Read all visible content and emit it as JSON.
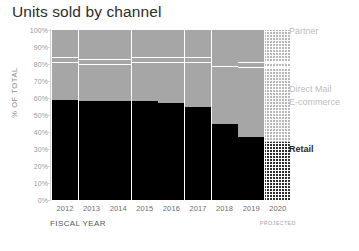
{
  "chart_data": {
    "type": "bar",
    "title": "Units sold by channel",
    "subtype": "stacked-100-percent",
    "xlabel": "FISCAL YEAR",
    "ylabel": "% OF TOTAL",
    "ylim": [
      0,
      100
    ],
    "ytick_labels": [
      "100%",
      "90%",
      "80%",
      "70%",
      "60%",
      "50%",
      "40%",
      "30%",
      "20%",
      "10%",
      "0%"
    ],
    "ytick_values": [
      100,
      90,
      80,
      70,
      60,
      50,
      40,
      30,
      20,
      10,
      0
    ],
    "grid": false,
    "legend_position": "right",
    "categories": [
      "2012",
      "2013",
      "2014",
      "2015",
      "2016",
      "2017",
      "2018",
      "2019",
      "2020"
    ],
    "projected_categories": [
      "2020"
    ],
    "projected_note": "PROJECTED",
    "series": [
      {
        "name": "Retail",
        "color": "#000000",
        "values": [
          59,
          58,
          58,
          58,
          57,
          55,
          45,
          37,
          34
        ]
      },
      {
        "name": "E-commerce",
        "color": "#a6a6a6",
        "values": [
          22,
          22,
          22,
          23,
          24,
          26,
          34,
          41,
          44
        ]
      },
      {
        "name": "Direct Mail",
        "color": "#a6a6a6",
        "values": [
          3,
          3,
          3,
          3,
          3,
          3,
          3,
          3,
          3
        ]
      },
      {
        "name": "Partner",
        "color": "#a6a6a6",
        "values": [
          16,
          17,
          17,
          16,
          16,
          16,
          18,
          19,
          19
        ]
      }
    ],
    "legend_entries": [
      {
        "label": "Partner",
        "color": "#bdbdbd"
      },
      {
        "label": "Direct Mail",
        "color": "#bdbdbd"
      },
      {
        "label": "E-commerce",
        "color": "#bdbdbd"
      },
      {
        "label": "Retail",
        "color": "#1f1f1f"
      }
    ]
  },
  "legend": {
    "partner": "Partner",
    "direct_mail": "Direct Mail",
    "ecommerce": "E-commerce",
    "retail": "Retail"
  },
  "axes": {
    "y_title": "% OF TOTAL",
    "x_title": "FISCAL YEAR",
    "projected": "PROJECTED"
  }
}
